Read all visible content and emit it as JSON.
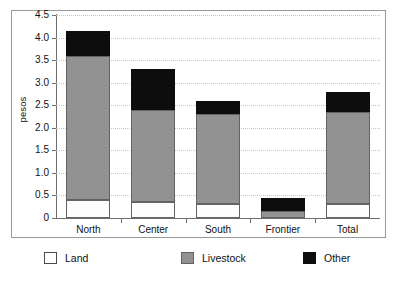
{
  "chart_data": {
    "type": "bar",
    "subtype": "stacked-bar",
    "title": "",
    "xlabel": "",
    "ylabel": "pesos",
    "ylim": [
      0,
      4.5
    ],
    "yticks": [
      "0",
      "0.5",
      "1.0",
      "1.5",
      "2.0",
      "2.5",
      "3.0",
      "3.5",
      "4.0",
      "4.5"
    ],
    "ytick_values": [
      0,
      0.5,
      1.0,
      1.5,
      2.0,
      2.5,
      3.0,
      3.5,
      4.0,
      4.5
    ],
    "grid": "horizontal-dotted",
    "legend_position": "bottom",
    "categories": [
      "North",
      "Center",
      "South",
      "Frontier",
      "Total"
    ],
    "series": [
      {
        "name": "Land",
        "color": "#ffffff",
        "values": [
          0.4,
          0.35,
          0.3,
          0.0,
          0.3
        ]
      },
      {
        "name": "Livestock",
        "color": "#929292",
        "values": [
          3.2,
          2.05,
          2.0,
          0.15,
          2.05
        ]
      },
      {
        "name": "Other",
        "color": "#0d0d0d",
        "values": [
          0.55,
          0.9,
          0.3,
          0.3,
          0.45
        ]
      }
    ],
    "totals": [
      4.15,
      3.3,
      2.6,
      0.45,
      2.8
    ]
  },
  "legend": {
    "items": [
      {
        "label": "Land",
        "swatch": "land-swatch"
      },
      {
        "label": "Livestock",
        "swatch": "livestock-swatch"
      },
      {
        "label": "Other",
        "swatch": "other-swatch"
      }
    ]
  }
}
